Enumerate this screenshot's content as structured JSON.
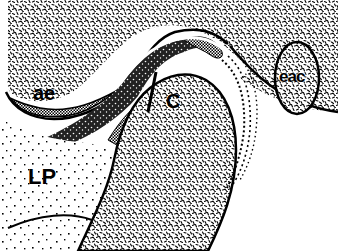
{
  "figure": {
    "type": "anatomical-illustration",
    "style": "black-and-white stippled line drawing",
    "colors": {
      "ink": "#000000",
      "paper": "#ffffff"
    },
    "labels": {
      "ae": "ae",
      "c": "C",
      "eac": "eac",
      "lp": "LP"
    },
    "regions": [
      {
        "id": "temporal-bone",
        "fill": "dense stipple"
      },
      {
        "id": "articular-eminence",
        "label_ref": "ae"
      },
      {
        "id": "condyle",
        "label_ref": "c",
        "fill": "dense stipple"
      },
      {
        "id": "external-auditory-canal",
        "label_ref": "eac",
        "shape": "ellipse"
      },
      {
        "id": "lateral-pterygoid",
        "label_ref": "lp",
        "fill": "sparse dots"
      },
      {
        "id": "articular-disc",
        "fill": "dark stipple band"
      },
      {
        "id": "retrodiscal-tissue",
        "fill": "dotted lines"
      }
    ]
  }
}
